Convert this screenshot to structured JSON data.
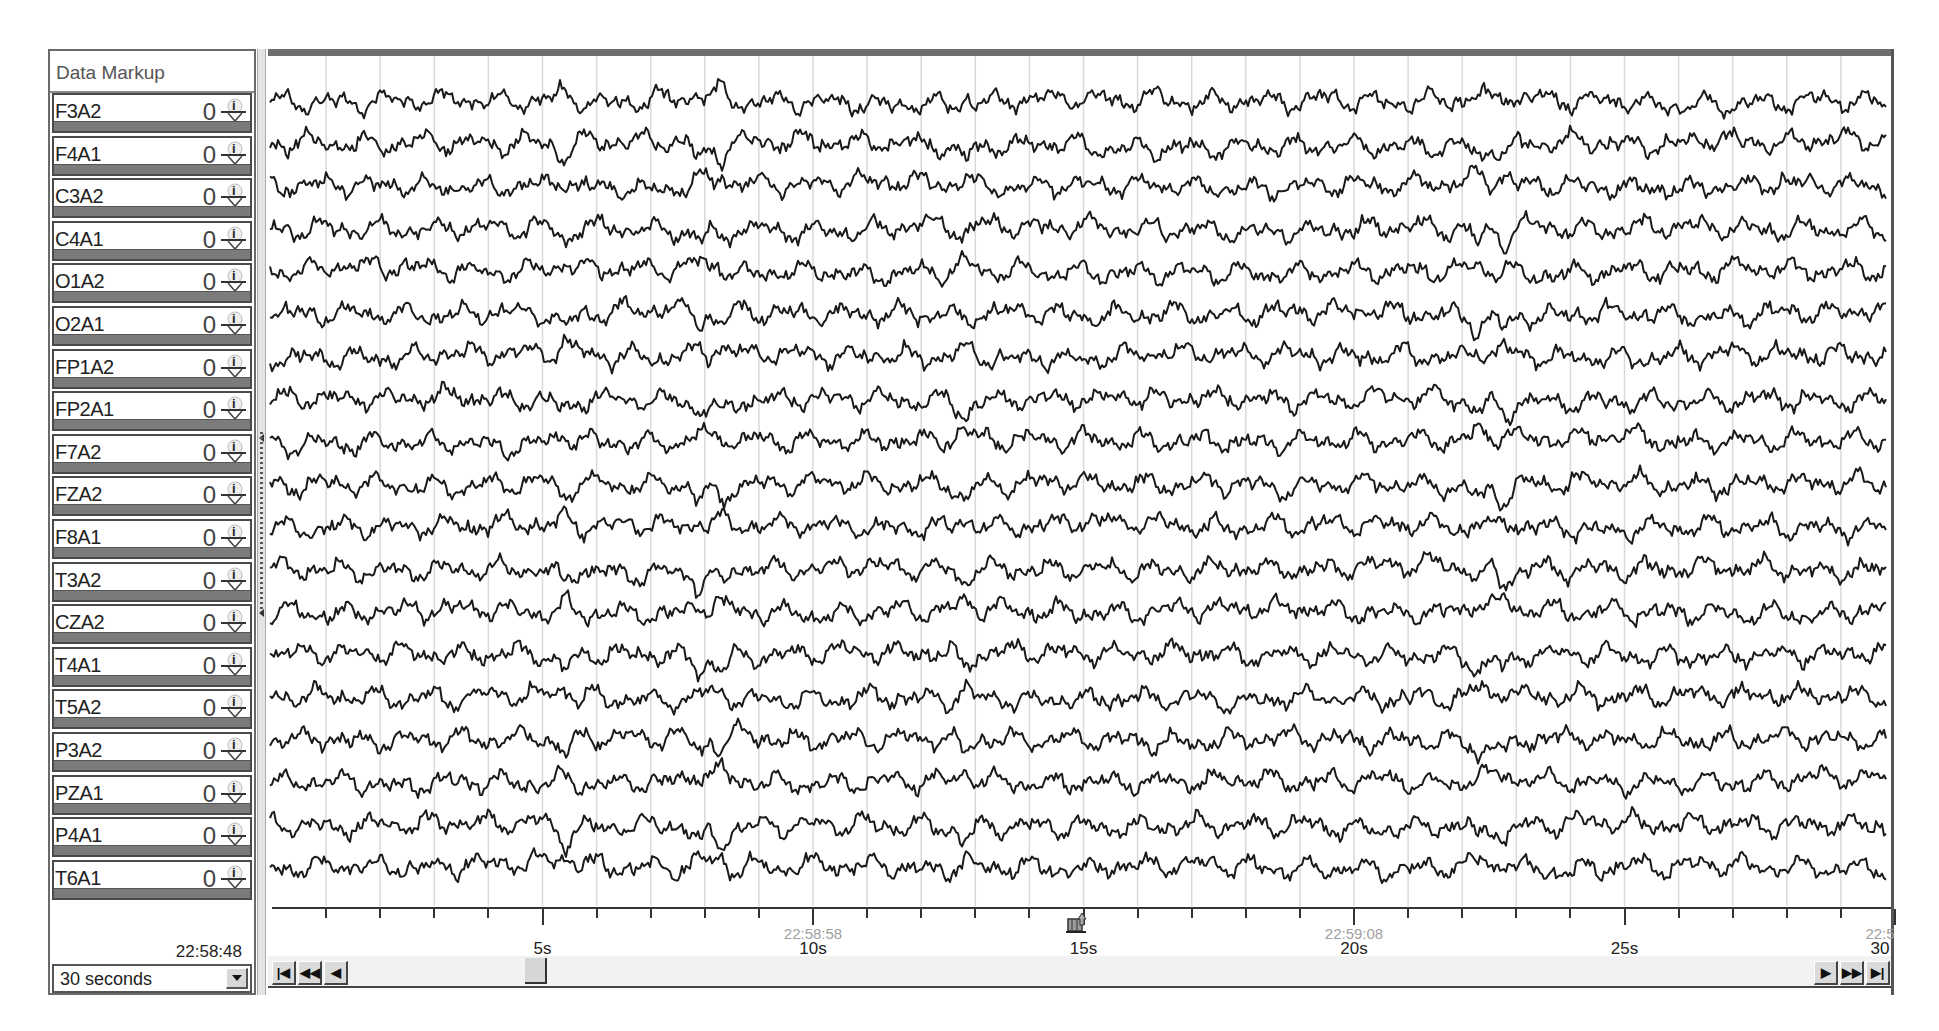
{
  "sidebar": {
    "header": "Data Markup",
    "channels": [
      {
        "label": "F3A2",
        "value": "0"
      },
      {
        "label": "F4A1",
        "value": "0"
      },
      {
        "label": "C3A2",
        "value": "0"
      },
      {
        "label": "C4A1",
        "value": "0"
      },
      {
        "label": "O1A2",
        "value": "0"
      },
      {
        "label": "O2A1",
        "value": "0"
      },
      {
        "label": "FP1A2",
        "value": "0"
      },
      {
        "label": "FP2A1",
        "value": "0"
      },
      {
        "label": "F7A2",
        "value": "0"
      },
      {
        "label": "FZA2",
        "value": "0"
      },
      {
        "label": "F8A1",
        "value": "0"
      },
      {
        "label": "T3A2",
        "value": "0"
      },
      {
        "label": "CZA2",
        "value": "0"
      },
      {
        "label": "T4A1",
        "value": "0"
      },
      {
        "label": "T5A2",
        "value": "0"
      },
      {
        "label": "P3A2",
        "value": "0"
      },
      {
        "label": "PZA1",
        "value": "0"
      },
      {
        "label": "P4A1",
        "value": "0"
      },
      {
        "label": "T6A1",
        "value": "0"
      }
    ],
    "start_time": "22:58:48",
    "window_select": {
      "selected": "30 seconds"
    },
    "marker_icon": "info-marker-icon"
  },
  "timeline": {
    "duration_seconds": 30,
    "tick_interval_seconds": 1,
    "labels": [
      {
        "seconds": 5,
        "label": "5s",
        "clock": ""
      },
      {
        "seconds": 10,
        "label": "10s",
        "clock": "22:58:58"
      },
      {
        "seconds": 15,
        "label": "15s",
        "clock": ""
      },
      {
        "seconds": 20,
        "label": "20s",
        "clock": "22:59:08"
      },
      {
        "seconds": 25,
        "label": "25s",
        "clock": ""
      },
      {
        "seconds": 30,
        "label": "30",
        "clock": "22:5"
      }
    ],
    "event_marker_seconds": 15,
    "scroll_thumb_position": "≈5s"
  },
  "navigation": {
    "left": [
      {
        "name": "first",
        "glyph": "⏮",
        "text": "K"
      },
      {
        "name": "page-back",
        "glyph": "⏪",
        "text": "◀◀"
      },
      {
        "name": "step-back",
        "glyph": "◀",
        "text": "◀"
      }
    ],
    "right": [
      {
        "name": "step-forward",
        "text": "▶"
      },
      {
        "name": "page-forward",
        "text": "▶▶"
      },
      {
        "name": "last",
        "text": "▶|"
      }
    ]
  },
  "colors": {
    "trace": "#1a1a1a",
    "grid": "#d9d9d9",
    "frame": "#555555",
    "channel_bar": "#7b7b7b"
  }
}
